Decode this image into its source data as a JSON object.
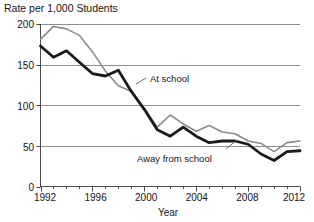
{
  "chart_data": {
    "type": "line",
    "title": "Rate per 1,000 Students",
    "xlabel": "Year",
    "ylabel": "",
    "xlim": [
      1992,
      2012
    ],
    "ylim": [
      0,
      200
    ],
    "grid": true,
    "grid_axis": "y",
    "legend_position": "inline-annotation",
    "xticks": [
      "1992",
      "1996",
      "2000",
      "2004",
      "2008",
      "2012"
    ],
    "xtick_values": [
      1992,
      1996,
      2000,
      2004,
      2008,
      2012
    ],
    "yticks": [
      "0",
      "50",
      "100",
      "150",
      "200"
    ],
    "ytick_values": [
      0,
      50,
      100,
      150,
      200
    ],
    "x": [
      1992,
      1993,
      1994,
      1995,
      1996,
      1997,
      1998,
      1999,
      2000,
      2001,
      2002,
      2003,
      2004,
      2005,
      2006,
      2007,
      2008,
      2009,
      2010,
      2011,
      2012
    ],
    "series": [
      {
        "name": "At school",
        "color": "#8a8a8a",
        "width": 1.6,
        "values": [
          181,
          197,
          194,
          186,
          166,
          142,
          124,
          117,
          96,
          73,
          88,
          77,
          68,
          75,
          67,
          65,
          56,
          53,
          43,
          54,
          56
        ]
      },
      {
        "name": "Away from school",
        "color": "#1a1a1a",
        "width": 2.8,
        "values": [
          173,
          159,
          167,
          153,
          139,
          136,
          143,
          117,
          95,
          70,
          62,
          73,
          62,
          54,
          56,
          56,
          52,
          40,
          32,
          43,
          44
        ]
      }
    ],
    "annotations": [
      {
        "text": "At school",
        "x": 2000,
        "y": 124,
        "leader": true
      },
      {
        "text": "Away from school",
        "x": 2003,
        "y": 30,
        "leader": true
      }
    ]
  },
  "labels": {
    "title": "Rate per 1,000 Students",
    "xlabel": "Year",
    "at_school": "At school",
    "away_from_school": "Away from school",
    "y0": "0",
    "y50": "50",
    "y100": "100",
    "y150": "150",
    "y200": "200",
    "x1992": "1992",
    "x1996": "1996",
    "x2000": "2000",
    "x2004": "2004",
    "x2008": "2008",
    "x2012": "2012"
  },
  "colors": {
    "at_school_line": "#8a8a8a",
    "away_from_school_line": "#1a1a1a",
    "grid": "#8f8f8f",
    "axis": "#4a4a4a",
    "background": "#ffffff",
    "text": "#141414"
  }
}
